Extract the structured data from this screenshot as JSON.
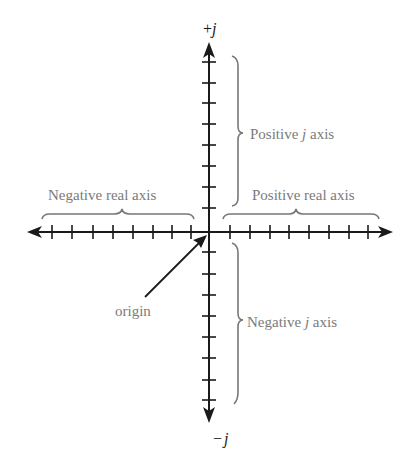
{
  "diagram": {
    "type": "complex-plane",
    "colors": {
      "axis": "#1a1a1a",
      "label": "#7a7a7a",
      "brace": "#777777",
      "background": "#ffffff"
    },
    "axis_labels": {
      "top": {
        "sign": "+",
        "var": "j"
      },
      "bottom": {
        "sign": "−",
        "var": "j"
      }
    },
    "annotations": {
      "positive_j": {
        "pre": "Positive ",
        "var": "j",
        "post": " axis"
      },
      "negative_j": {
        "pre": "Negative ",
        "var": "j",
        "post": " axis"
      },
      "negative_real": "Negative real axis",
      "positive_real": "Positive real axis",
      "origin": "origin"
    },
    "ticks": {
      "left_real": 8,
      "right_real": 8,
      "positive_j": 8,
      "negative_j": 8
    }
  }
}
